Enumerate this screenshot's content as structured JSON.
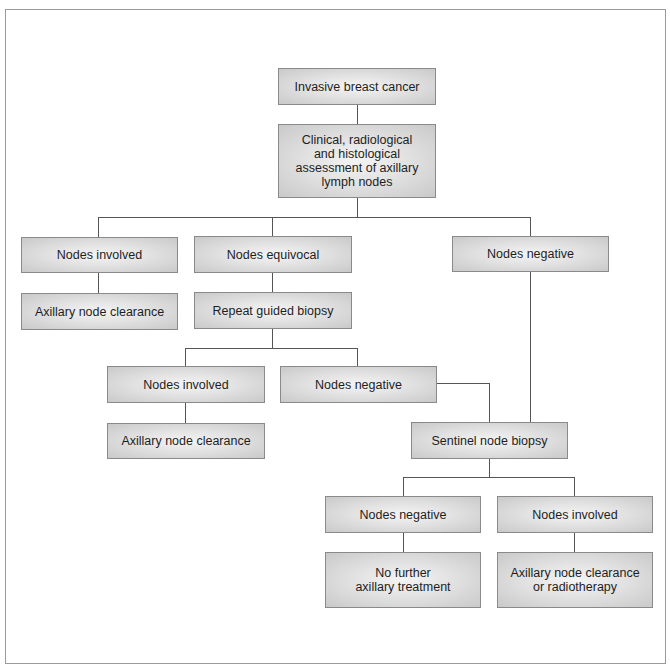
{
  "diagram": {
    "type": "flowchart",
    "nodes": {
      "root": "Invasive breast cancer",
      "assessment": "Clinical, radiological\nand histological\nassessment of axillary\nlymph nodes",
      "l1_involved": "Nodes involved",
      "l1_equivocal": "Nodes equivocal",
      "l1_negative": "Nodes negative",
      "l1_involved_clearance": "Axillary node clearance",
      "repeat_biopsy": "Repeat guided biopsy",
      "l2_involved": "Nodes involved",
      "l2_negative": "Nodes negative",
      "l2_involved_clearance": "Axillary node clearance",
      "sentinel": "Sentinel node biopsy",
      "l3_negative": "Nodes negative",
      "l3_involved": "Nodes involved",
      "no_further": "No further\naxillary treatment",
      "clearance_or_rt": "Axillary node clearance\nor radiotherapy"
    },
    "edges": [
      [
        "root",
        "assessment"
      ],
      [
        "assessment",
        "l1_involved"
      ],
      [
        "assessment",
        "l1_equivocal"
      ],
      [
        "assessment",
        "l1_negative"
      ],
      [
        "l1_involved",
        "l1_involved_clearance"
      ],
      [
        "l1_equivocal",
        "repeat_biopsy"
      ],
      [
        "repeat_biopsy",
        "l2_involved"
      ],
      [
        "repeat_biopsy",
        "l2_negative"
      ],
      [
        "l2_involved",
        "l2_involved_clearance"
      ],
      [
        "l2_negative",
        "sentinel"
      ],
      [
        "l1_negative",
        "sentinel"
      ],
      [
        "sentinel",
        "l3_negative"
      ],
      [
        "sentinel",
        "l3_involved"
      ],
      [
        "l3_negative",
        "no_further"
      ],
      [
        "l3_involved",
        "clearance_or_rt"
      ]
    ]
  }
}
